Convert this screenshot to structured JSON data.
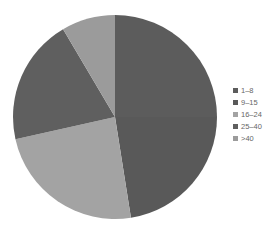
{
  "chart_data": {
    "type": "pie",
    "title": "",
    "categories": [
      "1–8",
      "9–15",
      "16–24",
      "25–40",
      ">40"
    ],
    "values": [
      25,
      22.5,
      24,
      20,
      8.5
    ],
    "unit": "percent (estimated)",
    "colors": [
      "#5c5c5c",
      "#595959",
      "#a3a3a3",
      "#5f5f5f",
      "#9b9b9b"
    ],
    "start_angle": "12 o'clock, clockwise",
    "legend_position": "right"
  },
  "legend": {
    "items": [
      {
        "label": "1–8",
        "color": "#5c5c5c"
      },
      {
        "label": "9–15",
        "color": "#595959"
      },
      {
        "label": "16–24",
        "color": "#a3a3a3"
      },
      {
        "label": "25–40",
        "color": "#5f5f5f"
      },
      {
        "label": ">40",
        "color": "#9b9b9b"
      }
    ]
  }
}
